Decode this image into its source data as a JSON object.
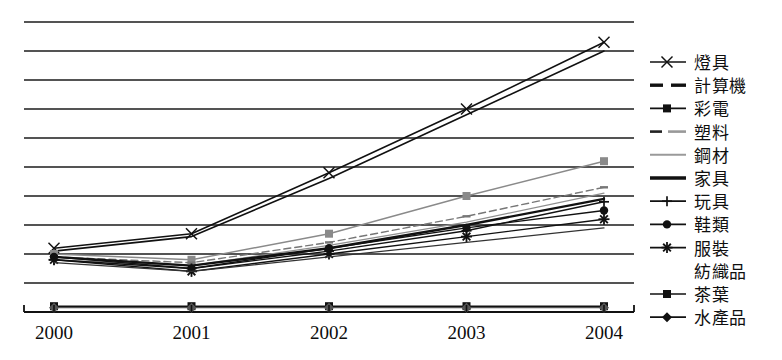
{
  "chart_data": {
    "type": "line",
    "title": "",
    "subtitle": "",
    "xlabel": "",
    "ylabel": "",
    "grid": true,
    "gridlines": 10,
    "legend_position": "right",
    "categories": [
      "2000",
      "2001",
      "2002",
      "2003",
      "2004"
    ],
    "x_tick_labels": [
      "2000",
      "2001",
      "2002",
      "2003",
      "2004"
    ],
    "y_tick_labels": [],
    "ylim": [
      0,
      100
    ],
    "series": [
      {
        "name": "燈具",
        "marker": "x",
        "dash": "solid",
        "width": 1.6,
        "color": "#111111",
        "values": [
          22,
          27,
          48,
          70,
          93
        ]
      },
      {
        "name": "計算機",
        "marker": "none",
        "dash": "solid",
        "width": 1.6,
        "color": "#111111",
        "values": [
          21,
          26,
          46,
          68,
          90
        ]
      },
      {
        "name": "彩電",
        "marker": "square",
        "dash": "solid",
        "width": 1.4,
        "color": "#8a8a8a",
        "values": [
          20,
          18,
          27,
          40,
          52
        ]
      },
      {
        "name": "塑料",
        "marker": "dash",
        "dash": "dashed",
        "width": 1.4,
        "color": "#777777",
        "values": [
          19,
          17,
          24,
          33,
          43
        ]
      },
      {
        "name": "鋼材",
        "marker": "none",
        "dash": "solid",
        "width": 1.2,
        "color": "#8f8f8f",
        "values": [
          18,
          16,
          23,
          31,
          41
        ]
      },
      {
        "name": "家具",
        "marker": "none",
        "dash": "solid",
        "width": 2.4,
        "color": "#111111",
        "values": [
          19,
          16,
          22,
          30,
          39
        ]
      },
      {
        "name": "玩具",
        "marker": "plus",
        "dash": "solid",
        "width": 1.4,
        "color": "#111111",
        "values": [
          18,
          15,
          21,
          28,
          38
        ]
      },
      {
        "name": "鞋類",
        "marker": "circle",
        "dash": "solid",
        "width": 1.4,
        "color": "#111111",
        "values": [
          19,
          15,
          22,
          29,
          35
        ]
      },
      {
        "name": "服裝",
        "marker": "star",
        "dash": "solid",
        "width": 1.4,
        "color": "#111111",
        "values": [
          18,
          14,
          20,
          26,
          32
        ]
      },
      {
        "name": "紡織品",
        "marker": "none",
        "dash": "solid",
        "width": 1.2,
        "color": "#333333",
        "values": [
          17,
          14,
          19,
          24,
          29
        ]
      },
      {
        "name": "茶葉",
        "marker": "square",
        "dash": "solid",
        "width": 1.6,
        "color": "#111111",
        "values": [
          2,
          2,
          2,
          2,
          2
        ]
      },
      {
        "name": "水產品",
        "marker": "diamond",
        "dash": "solid",
        "width": 1.2,
        "color": "#555555",
        "values": [
          1.5,
          1.5,
          1.5,
          1.5,
          1.5
        ]
      }
    ]
  },
  "legend": {
    "items": [
      {
        "label": "燈具",
        "marker": "x-marker"
      },
      {
        "label": "計算機",
        "marker": "dashed-line"
      },
      {
        "label": "彩電",
        "marker": "square-marker"
      },
      {
        "label": "塑料",
        "marker": "small-dash"
      },
      {
        "label": "鋼材",
        "marker": "thin-line"
      },
      {
        "label": "家具",
        "marker": "thick-line"
      },
      {
        "label": "玩具",
        "marker": "plus-marker"
      },
      {
        "label": "鞋類",
        "marker": "circle-marker"
      },
      {
        "label": "服裝",
        "marker": "star-marker"
      },
      {
        "label": "紡織品",
        "marker": "none"
      },
      {
        "label": "茶葉",
        "marker": "square-marker"
      },
      {
        "label": "水產品",
        "marker": "diamond-marker"
      }
    ]
  },
  "caption": {
    "text": ""
  }
}
